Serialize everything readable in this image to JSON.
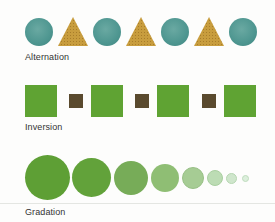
{
  "rows": [
    {
      "name": "alternation",
      "label": "Alternation",
      "description": "Alternating teal circles and golden triangles",
      "colors": {
        "circle": "#4e9690",
        "triangle": "#c49a3a"
      },
      "sequence": [
        "circle",
        "triangle",
        "circle",
        "triangle",
        "circle",
        "triangle",
        "circle"
      ]
    },
    {
      "name": "inversion",
      "label": "Inversion",
      "description": "Large green squares alternating with small dark brown squares",
      "colors": {
        "large_square": "#5fa333",
        "small_square": "#5a4a2e"
      },
      "sequence": [
        "large-square",
        "small-square",
        "large-square",
        "small-square",
        "large-square",
        "small-square",
        "large-square"
      ]
    },
    {
      "name": "gradation",
      "label": "Gradation",
      "description": "Green circles decreasing in size and lightening in color",
      "circles": [
        {
          "diameter": 45,
          "color": "#5e9f35"
        },
        {
          "diameter": 39,
          "color": "#62a23a"
        },
        {
          "diameter": 34,
          "color": "#77ac58"
        },
        {
          "diameter": 28,
          "color": "#8fbe74"
        },
        {
          "diameter": 22,
          "color": "#a6cc94"
        },
        {
          "diameter": 16,
          "color": "#bcdcb4"
        },
        {
          "diameter": 11,
          "color": "#cfe6cc"
        },
        {
          "diameter": 7,
          "color": "#dcefdc"
        }
      ]
    }
  ]
}
